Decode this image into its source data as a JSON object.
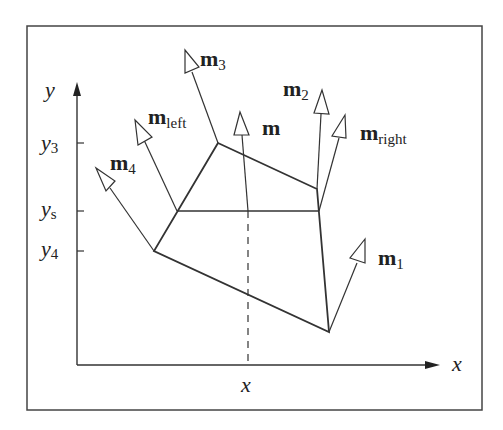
{
  "figure": {
    "axes": {
      "x_label": "x",
      "y_label": "y",
      "x_tick_label": "x",
      "y_ticks": [
        {
          "label_base": "y",
          "label_sub": "3",
          "name": "y3"
        },
        {
          "label_base": "y",
          "label_sub": "s",
          "name": "ys"
        },
        {
          "label_base": "y",
          "label_sub": "4",
          "name": "y4"
        }
      ]
    },
    "normals": [
      {
        "base": "m",
        "sub": "1",
        "name": "m1"
      },
      {
        "base": "m",
        "sub": "2",
        "name": "m2"
      },
      {
        "base": "m",
        "sub": "3",
        "name": "m3"
      },
      {
        "base": "m",
        "sub": "4",
        "name": "m4"
      },
      {
        "base": "m",
        "sub": "left",
        "name": "m-left"
      },
      {
        "base": "m",
        "sub": "right",
        "name": "m-right"
      },
      {
        "base": "m",
        "sub": "",
        "name": "m"
      }
    ],
    "colors": {
      "line": "#333333",
      "frame": "#444444",
      "background": "#ffffff"
    }
  }
}
